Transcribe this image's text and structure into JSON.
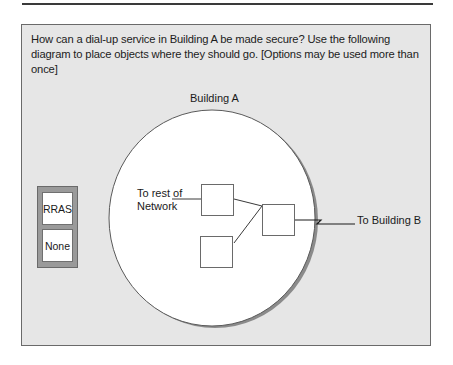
{
  "question": {
    "text": "How can a dial-up service in Building A be made secure?  Use the following diagram to place objects where they should go. [Options may be used more than once]"
  },
  "options": [
    {
      "label": "RRAS"
    },
    {
      "label": "None"
    }
  ],
  "diagram": {
    "building_label": "Building A",
    "network_label": "To rest of Network",
    "building_b_label": "To Building B",
    "drop_targets": [
      {
        "id": "target-1",
        "value": ""
      },
      {
        "id": "target-2",
        "value": ""
      },
      {
        "id": "target-3",
        "value": ""
      }
    ],
    "colors": {
      "panel_bg": "#e6e6e6",
      "tray_bg": "#9a9a9a",
      "circle_fill": "#ffffff",
      "circle_shadow": "#7a7a7a",
      "line": "#3a3a3a"
    }
  }
}
